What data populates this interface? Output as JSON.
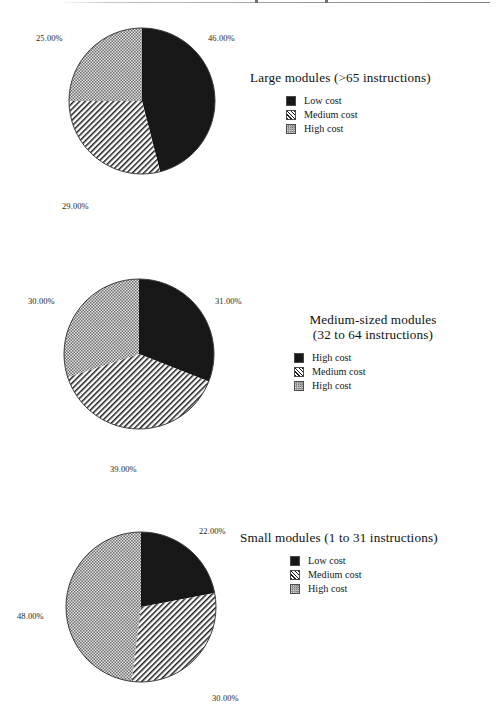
{
  "page": {
    "background": "#ffffff",
    "ink": "#1a1a1a"
  },
  "palette": {
    "low_cost": "#171717",
    "medium_cost_line": "#1d1d1d",
    "high_cost_dark": "#6b6b6b",
    "high_cost_light": "#e3e3e3"
  },
  "chart_data": [
    {
      "type": "pie",
      "title": "Large modules (>65 instructions)",
      "title_lines": [
        "Large modules (>65 instructions)"
      ],
      "categories": [
        "Low cost",
        "Medium cost",
        "High cost"
      ],
      "values": [
        46,
        29,
        25
      ],
      "labels": [
        "46.00%",
        "29.00%",
        "25.00%"
      ],
      "fills": [
        "solid-black",
        "diagonal-hatch",
        "checker-gray"
      ],
      "start_angle_deg": 0,
      "direction": "clockwise",
      "legend": [
        {
          "label": "Low cost",
          "fill": "solid-black"
        },
        {
          "label": "Medium cost",
          "fill": "diagonal-hatch"
        },
        {
          "label": "High cost",
          "fill": "checker-gray"
        }
      ],
      "legend_position": "right"
    },
    {
      "type": "pie",
      "title": "Medium-sized modules (32 to 64 instructions)",
      "title_lines": [
        "Medium-sized  modules",
        "(32 to 64 instructions)"
      ],
      "categories": [
        "High cost",
        "Medium cost",
        "High cost"
      ],
      "values": [
        31,
        39,
        30
      ],
      "labels": [
        "31.00%",
        "39.00%",
        "30.00%"
      ],
      "fills": [
        "solid-black",
        "diagonal-hatch",
        "checker-gray"
      ],
      "start_angle_deg": 0,
      "direction": "clockwise",
      "legend": [
        {
          "label": "High cost",
          "fill": "solid-black"
        },
        {
          "label": "Medium cost",
          "fill": "diagonal-hatch"
        },
        {
          "label": "High cost",
          "fill": "checker-gray"
        }
      ],
      "legend_position": "right"
    },
    {
      "type": "pie",
      "title": "Small modules (1 to 31 instructions)",
      "title_lines": [
        "Small modules (1 to 31 instructions)"
      ],
      "categories": [
        "Low cost",
        "Medium cost",
        "High cost"
      ],
      "values": [
        22,
        30,
        48
      ],
      "labels": [
        "22.00%",
        "30.00%",
        "48.00%"
      ],
      "fills": [
        "solid-black",
        "diagonal-hatch",
        "checker-gray"
      ],
      "start_angle_deg": 0,
      "direction": "clockwise",
      "legend": [
        {
          "label": "Low cost",
          "fill": "solid-black"
        },
        {
          "label": "Medium cost",
          "fill": "diagonal-hatch"
        },
        {
          "label": "High cost",
          "fill": "checker-gray"
        }
      ],
      "legend_position": "right"
    }
  ]
}
